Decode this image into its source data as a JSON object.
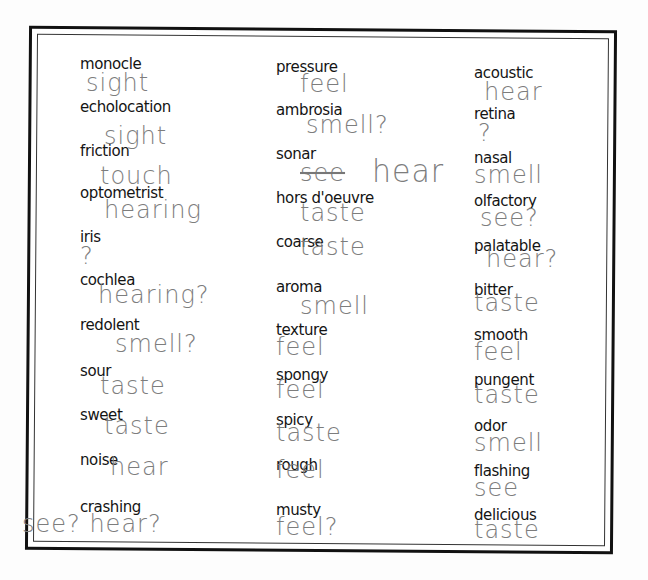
{
  "worksheet": {
    "columns": [
      [
        {
          "word": "monocle",
          "answer": "sight"
        },
        {
          "word": "echolocation",
          "answer": "sight"
        },
        {
          "word": "friction",
          "answer": "touch"
        },
        {
          "word": "optometrist",
          "answer": "hearing"
        },
        {
          "word": "iris",
          "answer": "?"
        },
        {
          "word": "cochlea",
          "answer": "hearing?"
        },
        {
          "word": "redolent",
          "answer": "smell?"
        },
        {
          "word": "sour",
          "answer": "taste"
        },
        {
          "word": "sweet",
          "answer": "taste"
        },
        {
          "word": "noise",
          "answer": "hear"
        },
        {
          "word": "crashing",
          "answer": "see? hear?"
        }
      ],
      [
        {
          "word": "pressure",
          "answer": "feel"
        },
        {
          "word": "ambrosia",
          "answer": "smell?"
        },
        {
          "word": "sonar",
          "answer_struck": "see",
          "answer": "hear"
        },
        {
          "word": "hors d'oeuvre",
          "answer": "taste"
        },
        {
          "word": "coarse",
          "answer": "taste"
        },
        {
          "word": "aroma",
          "answer": "smell"
        },
        {
          "word": "texture",
          "answer": "feel"
        },
        {
          "word": "spongy",
          "answer": "feel"
        },
        {
          "word": "spicy",
          "answer": "taste"
        },
        {
          "word": "rough",
          "answer": "feel"
        },
        {
          "word": "musty",
          "answer": "feel?"
        }
      ],
      [
        {
          "word": "acoustic",
          "answer": "hear"
        },
        {
          "word": "retina",
          "answer": "?"
        },
        {
          "word": "nasal",
          "answer": "smell"
        },
        {
          "word": "olfactory",
          "answer": "see?"
        },
        {
          "word": "palatable",
          "answer": "hear?"
        },
        {
          "word": "bitter",
          "answer": "taste"
        },
        {
          "word": "smooth",
          "answer": "feel"
        },
        {
          "word": "pungent",
          "answer": "taste"
        },
        {
          "word": "odor",
          "answer": "smell"
        },
        {
          "word": "flashing",
          "answer": "see"
        },
        {
          "word": "delicious",
          "answer": "taste"
        }
      ]
    ]
  },
  "colors": {
    "print": "#141414",
    "pencil": "#7d7d7d",
    "border": "#111111"
  }
}
